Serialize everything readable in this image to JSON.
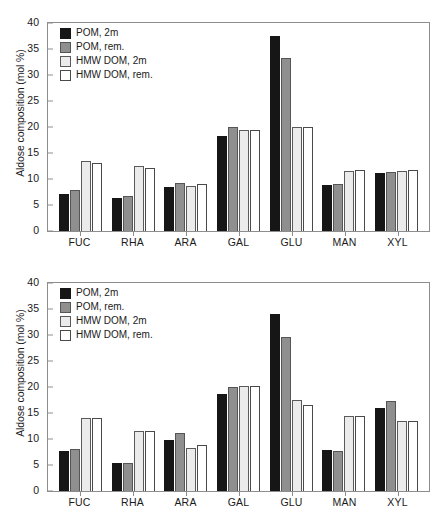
{
  "figure": {
    "background": "#ffffff",
    "series_colors": [
      "#161616",
      "#8f8f8f",
      "#ebebeb",
      "#ffffff"
    ]
  },
  "chart_data": [
    {
      "type": "bar",
      "title": "2°S",
      "xlabel": "",
      "ylabel": "Aldose composition (mol %)",
      "categories": [
        "FUC",
        "RHA",
        "ARA",
        "GAL",
        "GLU",
        "MAN",
        "XYL"
      ],
      "ylim": [
        0,
        40
      ],
      "yticks": [
        0,
        5,
        10,
        15,
        20,
        25,
        30,
        35,
        40
      ],
      "grid": false,
      "legend_position": "top-left",
      "series": [
        {
          "name": "POM, 2m",
          "color": "#161616",
          "values": [
            7.2,
            6.4,
            8.5,
            18.2,
            37.5,
            8.8,
            11.1
          ]
        },
        {
          "name": "POM, rem.",
          "color": "#8f8f8f",
          "values": [
            7.8,
            6.7,
            9.3,
            20.0,
            33.3,
            9.0,
            11.4
          ]
        },
        {
          "name": "HMW DOM, 2m",
          "color": "#ebebeb",
          "values": [
            13.5,
            12.5,
            8.6,
            19.5,
            20.0,
            11.6,
            11.6
          ]
        },
        {
          "name": "HMW DOM, rem.",
          "color": "#ffffff",
          "values": [
            13.1,
            12.2,
            9.1,
            19.5,
            20.0,
            11.8,
            11.7
          ]
        }
      ]
    },
    {
      "type": "bar",
      "title": "12°S",
      "xlabel": "",
      "ylabel": "Aldose composition (mol %)",
      "categories": [
        "FUC",
        "RHA",
        "ARA",
        "GAL",
        "GLU",
        "MAN",
        "XYL"
      ],
      "ylim": [
        0,
        40
      ],
      "yticks": [
        0,
        5,
        10,
        15,
        20,
        25,
        30,
        35,
        40
      ],
      "grid": false,
      "legend_position": "top-left",
      "series": [
        {
          "name": "POM, 2m",
          "color": "#161616",
          "values": [
            7.6,
            5.4,
            9.8,
            18.6,
            34.0,
            7.8,
            15.9
          ]
        },
        {
          "name": "POM, rem.",
          "color": "#8f8f8f",
          "values": [
            8.1,
            5.4,
            11.2,
            20.0,
            29.6,
            7.6,
            17.4
          ]
        },
        {
          "name": "HMW DOM, 2m",
          "color": "#ebebeb",
          "values": [
            14.0,
            11.5,
            8.3,
            20.1,
            17.5,
            14.4,
            13.4
          ]
        },
        {
          "name": "HMW DOM, rem.",
          "color": "#ffffff",
          "values": [
            14.1,
            11.5,
            8.9,
            20.2,
            16.5,
            14.4,
            13.4
          ]
        }
      ]
    }
  ]
}
